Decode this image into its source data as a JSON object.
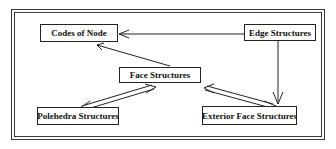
{
  "diagram": {
    "nodes": {
      "codes_of_node": {
        "label": "Codes of Node"
      },
      "edge_structures": {
        "label": "Edge Structures"
      },
      "face_structures": {
        "label": "Face Structures"
      },
      "polehedra_structures": {
        "label": "Polehedra Structures"
      },
      "exterior_face_structures": {
        "label": "Exterior Face Structures"
      }
    },
    "edges": [
      {
        "from": "edge_structures",
        "to": "codes_of_node",
        "style": "single-arrow"
      },
      {
        "from": "face_structures",
        "to": "codes_of_node",
        "style": "single-arrow"
      },
      {
        "from": "edge_structures",
        "to": "exterior_face_structures",
        "style": "single-arrow"
      },
      {
        "from": "face_structures",
        "to": "polehedra_structures",
        "style": "double-line-bidirectional"
      },
      {
        "from": "face_structures",
        "to": "exterior_face_structures",
        "style": "double-line-bidirectional"
      }
    ],
    "colors": {
      "line": "#222222",
      "background": "#ffffff"
    }
  }
}
